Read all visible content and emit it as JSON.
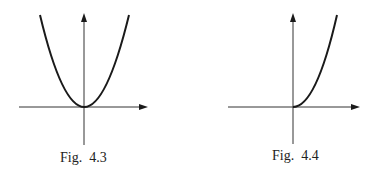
{
  "figures": [
    {
      "caption": "Fig.  4.3",
      "curve": "parabola y = x^2 (symmetric, vertex at origin)",
      "axes": [
        "x-axis with arrow",
        "y-axis with arrow"
      ]
    },
    {
      "caption": "Fig.  4.4",
      "curve": "curve starting at origin increasing for x >= 0 (right half only)",
      "axes": [
        "x-axis with arrow",
        "y-axis with arrow"
      ]
    }
  ],
  "colors": {
    "ink": "#1a1a1a",
    "background": "#ffffff"
  }
}
